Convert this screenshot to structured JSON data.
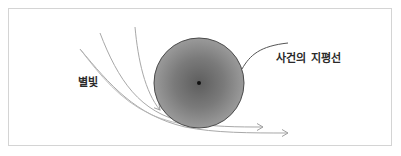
{
  "diagram": {
    "labels": {
      "starlight": "별빛",
      "event_horizon": "사건의 지평선"
    },
    "colors": {
      "frame_border": "#d4d4d4",
      "black_hole_outer": "#8a8a8a",
      "black_hole_inner": "#6a6a6a",
      "black_hole_edge": "#4a4a4a",
      "singularity": "#111111",
      "light_path": "#a8a8a8",
      "leader_line": "#555555",
      "text": "#2a2a2a"
    },
    "elements": {
      "black_hole": {
        "cx": 199,
        "cy": 83,
        "r": 45
      },
      "light_paths": 4,
      "arrows": 3
    }
  }
}
